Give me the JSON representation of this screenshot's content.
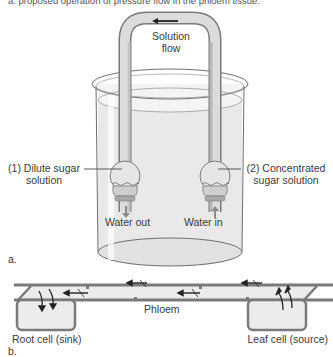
{
  "caption_top": "a. proposed operation of pressure flow in the phloem tissue.",
  "panel_a": {
    "tube_label_line1": "Solution",
    "tube_label_line2": "flow",
    "bulb1_label_line1": "(1) Dilute sugar",
    "bulb1_label_line2": "solution",
    "bulb2_label_line1": "(2) Concentrated",
    "bulb2_label_line2": "sugar solution",
    "water_out": "Water out",
    "water_in": "Water in",
    "panel_letter": "a."
  },
  "panel_b": {
    "phloem_label": "Phloem",
    "root_label": "Root cell (sink)",
    "leaf_label": "Leaf cell (source)",
    "panel_letter": "b."
  },
  "colors": {
    "tube_fill": "#d9d9d9",
    "tube_stroke": "#7a7a7a",
    "water_fill": "#ececec",
    "arrow": "#222222",
    "gray_arrow": "#8a8a8a"
  }
}
